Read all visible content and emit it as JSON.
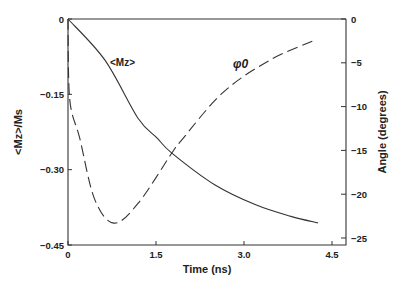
{
  "chart_data": {
    "type": "line",
    "title": "",
    "xlabel": "Time (ns)",
    "ylabel": "<Mz>/Ms",
    "y2label": "Angle (degrees)",
    "xlim": [
      0,
      4.7
    ],
    "ylim": [
      -0.45,
      0
    ],
    "y2lim": [
      -25.8,
      0
    ],
    "x_ticks": [
      "0",
      "1.5",
      "3.0",
      "4.5"
    ],
    "y_ticks": [
      "0",
      "-0.15",
      "-0.30",
      "-0.45"
    ],
    "y2_ticks": [
      "0",
      "-5",
      "-10",
      "-15",
      "-20",
      "-25"
    ],
    "grid": false,
    "legend": "inline labels",
    "series": [
      {
        "name": "<Mz>",
        "axis": "left",
        "style": "solid",
        "x": [
          0,
          0.63,
          1.19,
          1.52,
          1.77,
          2.5,
          3.2,
          3.8,
          4.26
        ],
        "values": [
          0,
          -0.082,
          -0.197,
          -0.237,
          -0.267,
          -0.33,
          -0.37,
          -0.393,
          -0.406
        ]
      },
      {
        "name": "φ0",
        "axis": "right",
        "style": "dashed",
        "x": [
          0,
          0.03,
          0.2,
          0.45,
          0.78,
          1.2,
          1.77,
          1.94,
          2.64,
          3.44,
          4.21
        ],
        "values": [
          0,
          -9.2,
          -13.6,
          -20.5,
          -23.3,
          -21.0,
          -15.3,
          -13.8,
          -8.4,
          -4.7,
          -2.4
        ]
      }
    ]
  },
  "labels": {
    "mz_inline": "<Mz>",
    "phi_inline": "φ0"
  }
}
